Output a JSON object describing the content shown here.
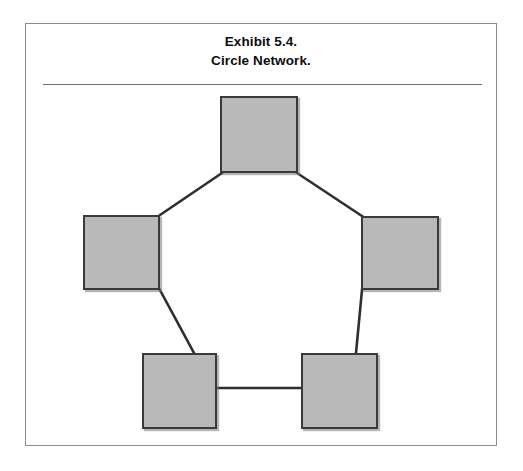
{
  "exhibit": {
    "title_line_1": "Exhibit 5.4.",
    "title_line_2": "Circle Network.",
    "frame": {
      "x": 25,
      "y": 23,
      "width": 472,
      "height": 423
    },
    "rule": {
      "x": 17,
      "y": 60,
      "width": 439
    }
  },
  "colors": {
    "node_fill": "#b9b9b9",
    "node_border": "#3a3a3a",
    "edge": "#2f2f2f",
    "frame_border": "#8c8c8c",
    "rule": "#6e6e6e",
    "background": "#ffffff",
    "title_text": "#0d0d0d"
  },
  "chart_data": {
    "type": "diagram",
    "title": "Exhibit 5.4. Circle Network.",
    "layout": "pentagon-ring",
    "node_count": 5,
    "edge_count": 5,
    "nodes": [
      {
        "id": "top",
        "label": "",
        "x": 194,
        "y": 72,
        "width": 78,
        "height": 77
      },
      {
        "id": "left",
        "label": "",
        "x": 57,
        "y": 191,
        "width": 77,
        "height": 75
      },
      {
        "id": "right",
        "label": "",
        "x": 335,
        "y": 192,
        "width": 78,
        "height": 74
      },
      {
        "id": "bottom-left",
        "label": "",
        "x": 116,
        "y": 329,
        "width": 75,
        "height": 76
      },
      {
        "id": "bottom-right",
        "label": "",
        "x": 275,
        "y": 329,
        "width": 77,
        "height": 76
      }
    ],
    "edges": [
      {
        "from": "top",
        "to": "left",
        "x1": 196,
        "y1": 149,
        "x2": 134,
        "y2": 191,
        "kind": "diagonal"
      },
      {
        "from": "top",
        "to": "right",
        "x1": 271,
        "y1": 149,
        "x2": 336,
        "y2": 192,
        "kind": "diagonal"
      },
      {
        "from": "left",
        "to": "bottom-left",
        "x1": 134,
        "y1": 266,
        "x2": 168,
        "y2": 329,
        "kind": "diagonal"
      },
      {
        "from": "right",
        "to": "bottom-right",
        "x1": 336,
        "y1": 266,
        "x2": 330,
        "y2": 329,
        "kind": "diagonal"
      },
      {
        "from": "bottom-left",
        "to": "bottom-right",
        "x1": 191,
        "y1": 364,
        "x2": 276,
        "y2": 364,
        "kind": "horizontal"
      }
    ]
  }
}
